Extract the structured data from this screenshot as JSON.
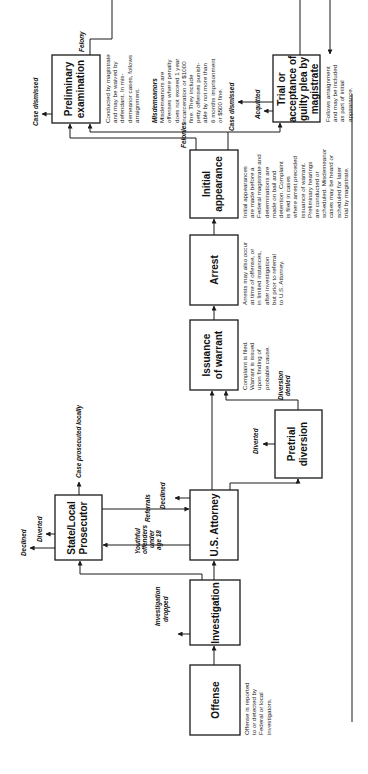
{
  "diagram": {
    "orientation": "rotated 90 degrees counter-clockwise",
    "boxes": {
      "offense": {
        "title": [
          "Offense"
        ],
        "note": [
          "Offense is reported",
          "to or detected by",
          "Federal or local",
          "investigators."
        ]
      },
      "investigation": {
        "title": [
          "Investigation"
        ]
      },
      "us_attorney": {
        "title": [
          "U.S. Attorney"
        ]
      },
      "state_local": {
        "title": [
          "State/Local",
          "Prosecutor"
        ]
      },
      "pretrial_diversion": {
        "title": [
          "Pretrial",
          "diversion"
        ]
      },
      "issuance_warrant": {
        "title": [
          "Issuance",
          "of warrant"
        ],
        "note": [
          "Complaint is filed.",
          "Warrant is issued",
          "upon finding of",
          "probable cause."
        ]
      },
      "arrest": {
        "title": [
          "Arrest"
        ],
        "note": [
          "Arrests may also occur",
          "at time of offense, or",
          "in limited instances,",
          "after investigation",
          "but prior to referral",
          "to U.S. Attorney."
        ]
      },
      "initial_appearance": {
        "title": [
          "Initial",
          "appearance"
        ],
        "note": [
          "Initial appearances",
          "are made before a",
          "Federal magistrate and",
          "determinations are",
          "made on bail and",
          "detention. Complaint",
          "is filed in cases",
          "where arrest preceded",
          "issuance of warrant.",
          "Preliminary hearings",
          "are conducted or",
          "scheduled. Misdemeanor",
          "cases may be heard or",
          "scheduled for later",
          "trial by magistrate."
        ]
      },
      "preliminary_exam": {
        "title": [
          "Preliminary",
          "examination"
        ],
        "note": [
          "Conducted by magistrate",
          "and may be waived by",
          "defendant. In mis-",
          "demeanor cases, follows",
          "arraignment."
        ]
      },
      "trial_magistrate": {
        "title": [
          "Trial or",
          "acceptance of",
          "guilty plea by",
          "magistrate"
        ],
        "note": [
          "Follows arraignment",
          "and may be included",
          "as part of initial",
          "appearance."
        ]
      }
    },
    "misdemeanors_note": {
      "heading": "Misdemeanors",
      "lines": [
        "Misdemeanors are",
        "offenses where penalty",
        "does not exceed 1 year",
        "incarceration or $1000",
        "fine. They include",
        "petty offenses punish-",
        "able by not more than",
        "6 months imprisonment",
        "or $500 fine."
      ]
    },
    "edge_labels": {
      "investigation_dropped": [
        "Investigation",
        "dropped"
      ],
      "youthful_offenders": [
        "Youthful",
        "offenders",
        "under",
        "age 18"
      ],
      "referrals": "Referrals",
      "declined_usa": "Declined",
      "declined_state": "Declined",
      "diverted_state": "Diverted",
      "case_prosecuted_locally": "Case prosecuted locally",
      "diverted_pretrial": "Diverted",
      "diversion_denied": [
        "Diversion",
        "denied"
      ],
      "felonies": "Felonies",
      "felony": "Felony",
      "case_dismissed_prelim": "Case dismissed",
      "case_dismissed_trial": "Case dismissed",
      "acquitted": "Acquitted"
    }
  }
}
